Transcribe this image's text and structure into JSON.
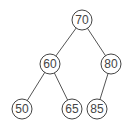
{
  "diagram": {
    "type": "binary-tree",
    "nodes": [
      {
        "id": "n70",
        "label": "70",
        "x": 82,
        "y": 20
      },
      {
        "id": "n60",
        "label": "60",
        "x": 50,
        "y": 64
      },
      {
        "id": "n80",
        "label": "80",
        "x": 111,
        "y": 64
      },
      {
        "id": "n50",
        "label": "50",
        "x": 22,
        "y": 109
      },
      {
        "id": "n65",
        "label": "65",
        "x": 72,
        "y": 109
      },
      {
        "id": "n85",
        "label": "85",
        "x": 97,
        "y": 109
      }
    ],
    "edges": [
      {
        "from": "70",
        "to": "60"
      },
      {
        "from": "70",
        "to": "80"
      },
      {
        "from": "60",
        "to": "50"
      },
      {
        "from": "60",
        "to": "65"
      },
      {
        "from": "80",
        "to": "85"
      }
    ],
    "colors": {
      "stroke": "#444444",
      "text": "#444444",
      "background": "#ffffff"
    }
  }
}
